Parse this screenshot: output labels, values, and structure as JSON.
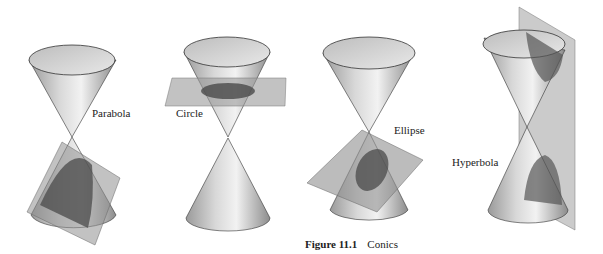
{
  "figure": {
    "caption_number": "Figure 11.1",
    "caption_text": "Conics"
  },
  "panels": [
    {
      "name": "parabola",
      "label": "Parabola"
    },
    {
      "name": "circle",
      "label": "Circle"
    },
    {
      "name": "ellipse",
      "label": "Ellipse"
    },
    {
      "name": "hyperbola",
      "label": "Hyperbola"
    }
  ],
  "colors": {
    "cone_light": "#e6e6e6",
    "cone_dark": "#8a8a8a",
    "plane": "#9a9a9a",
    "section": "#555555",
    "outline": "#333333"
  }
}
